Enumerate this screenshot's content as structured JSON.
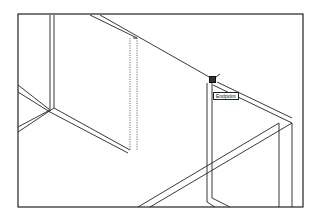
{
  "viewport": {
    "frame": {
      "x": 18,
      "y": 14,
      "width": 285,
      "height": 193
    },
    "stroke_color": "#222222",
    "background": "#ffffff"
  },
  "snap": {
    "tooltip_label": "Endpoint",
    "marker_position": {
      "x": 211,
      "y": 78
    }
  },
  "drawing": {
    "solid_lines": [
      [
        50,
        15,
        50,
        110
      ],
      [
        54,
        15,
        54,
        108
      ],
      [
        90,
        15,
        137,
        38
      ],
      [
        100,
        15,
        211,
        78
      ],
      [
        18,
        85,
        50,
        110
      ],
      [
        18,
        92,
        50,
        112
      ],
      [
        50,
        110,
        18,
        127
      ],
      [
        54,
        108,
        18,
        132
      ],
      [
        54,
        108,
        130,
        150
      ],
      [
        50,
        112,
        128,
        153
      ],
      [
        133,
        38,
        137,
        38
      ],
      [
        207,
        83,
        207,
        202
      ],
      [
        212,
        83,
        212,
        198
      ],
      [
        213,
        85,
        292,
        123
      ],
      [
        217,
        82,
        292,
        118
      ],
      [
        279,
        123,
        279,
        207
      ],
      [
        292,
        123,
        292,
        207
      ],
      [
        279,
        123,
        138,
        207
      ],
      [
        292,
        123,
        150,
        207
      ],
      [
        207,
        202,
        215,
        207
      ],
      [
        212,
        198,
        230,
        207
      ],
      [
        212,
        80,
        220,
        74
      ]
    ],
    "dashed_lines": [
      [
        130,
        38,
        130,
        150
      ],
      [
        137,
        38,
        137,
        150
      ]
    ]
  }
}
